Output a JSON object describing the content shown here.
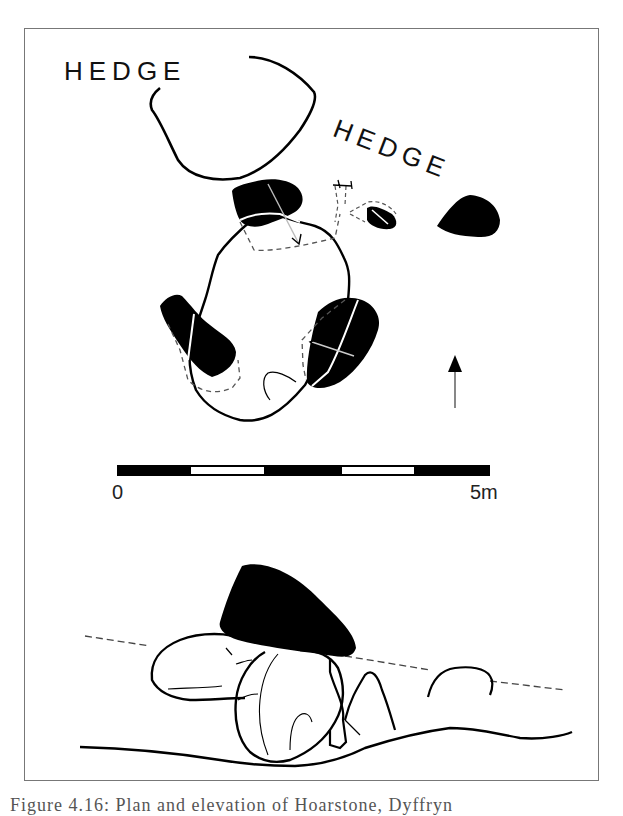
{
  "figure": {
    "type": "archaeological plan and elevation drawing",
    "plan": {
      "labels": [
        {
          "id": "hedge-label-left",
          "text": "HEDGE"
        },
        {
          "id": "hedge-label-right",
          "text": "HEDGE"
        }
      ],
      "north_arrow": {
        "direction": "up"
      }
    },
    "scale_bar": {
      "start_label": "0",
      "end_label": "5m",
      "segments": [
        "black",
        "white",
        "black",
        "white",
        "black"
      ]
    },
    "elevation": {
      "capstone": "black filled",
      "ground_line": "solid",
      "mound_line": "dashed"
    },
    "colors": {
      "ink": "#000000",
      "frame": "#777777",
      "background": "#ffffff"
    },
    "caption": "Figure 4.16: Plan and elevation of Hoarstone, Dyffryn"
  }
}
